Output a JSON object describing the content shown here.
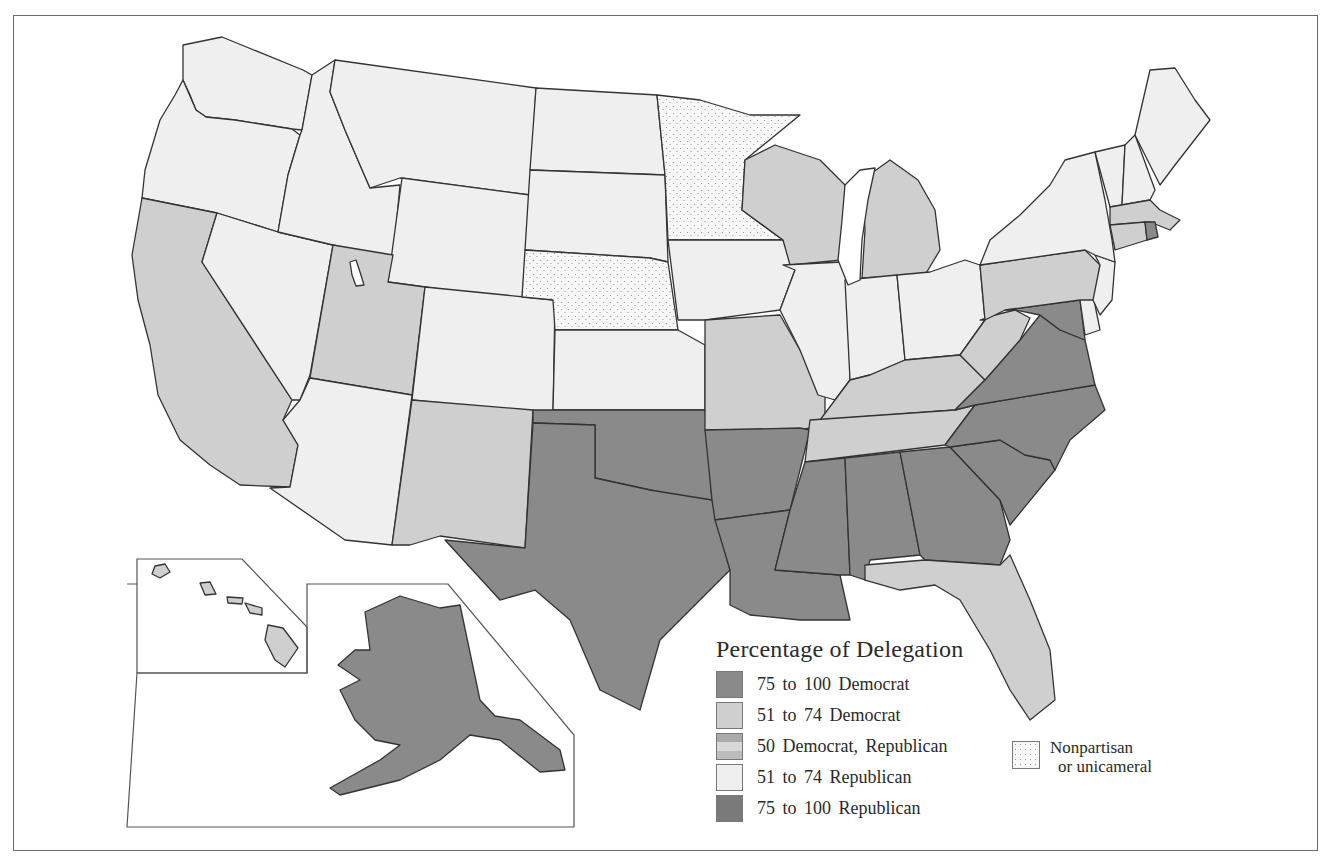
{
  "legend": {
    "title": "Percentage of Delegation",
    "items": [
      {
        "label": "75  to 100  Democrat",
        "color": "#8a8a8a",
        "pattern": "solid"
      },
      {
        "label": "51  to 74  Democrat",
        "color": "#cfcfcf",
        "pattern": "solid"
      },
      {
        "label": "50  Democrat, Republican",
        "color": "#bdbdbd",
        "pattern": "banded"
      },
      {
        "label": "51  to 74  Republican",
        "color": "#efefef",
        "pattern": "solid"
      },
      {
        "label": "75  to 100  Republican",
        "color": "#7a7a7a",
        "pattern": "solid"
      }
    ],
    "nonpartisan": {
      "line1": "Nonpartisan",
      "line2": "or unicameral",
      "pattern": "dotted"
    }
  },
  "map": {
    "title": "Percentage of Delegation",
    "categories": {
      "dem_75_100": [
        "Alaska",
        "Texas",
        "Oklahoma",
        "Arkansas",
        "Louisiana",
        "Mississippi",
        "Alabama",
        "Georgia",
        "South Carolina",
        "North Carolina",
        "Virginia",
        "Maryland",
        "Rhode Island"
      ],
      "dem_51_74": [
        "California",
        "Utah",
        "New Mexico",
        "Missouri",
        "Wisconsin",
        "Michigan",
        "Kentucky",
        "Tennessee",
        "West Virginia",
        "Pennsylvania",
        "Massachusetts",
        "Connecticut",
        "Florida",
        "Hawaii"
      ],
      "rep_51_74": [
        "Washington",
        "Oregon",
        "Idaho",
        "Montana",
        "Wyoming",
        "Nevada",
        "Colorado",
        "Arizona",
        "North Dakota",
        "South Dakota",
        "Kansas",
        "Iowa",
        "Illinois",
        "Indiana",
        "Ohio",
        "New York",
        "Vermont",
        "New Hampshire",
        "Maine",
        "New Jersey",
        "Delaware"
      ],
      "nonpartisan_or_unicameral": [
        "Minnesota",
        "Nebraska"
      ]
    },
    "insets": [
      "Alaska",
      "Hawaii"
    ]
  }
}
